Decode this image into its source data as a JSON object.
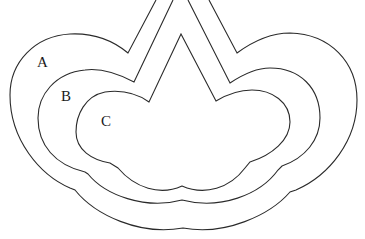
{
  "diagram": {
    "type": "nested-regions",
    "stroke_color": "#2a2a2a",
    "background": "#ffffff",
    "regions": [
      {
        "id": "A",
        "label": "A",
        "level": "outer"
      },
      {
        "id": "B",
        "label": "B",
        "level": "middle"
      },
      {
        "id": "C",
        "label": "C",
        "level": "inner"
      }
    ]
  }
}
